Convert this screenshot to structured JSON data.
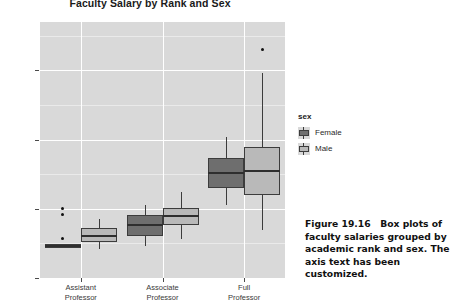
{
  "figure": {
    "title": "Faculty Salary by Rank and Sex",
    "caption_label": "Figure 19.16",
    "caption_text": "Box plots of faculty salaries grouped by academic rank and sex. The axis text has been customized."
  },
  "legend": {
    "title": "sex",
    "items": [
      {
        "label": "Female",
        "color": "#6e6e6e",
        "key_icon": "boxplot-key-icon"
      },
      {
        "label": "Male",
        "color": "#b9b9b9",
        "key_icon": "boxplot-key-icon"
      }
    ]
  },
  "axes": {
    "y_ticks": [
      "$200K",
      "$150K",
      "$100K",
      "$50K"
    ],
    "y_tick_values": [
      200000,
      150000,
      100000,
      50000
    ],
    "x_ticks": [
      {
        "line1": "Assistant",
        "line2": "Professor"
      },
      {
        "line1": "Associate",
        "line2": "Professor"
      },
      {
        "line1": "Full",
        "line2": "Professor"
      }
    ],
    "xlabel": "",
    "ylabel": ""
  },
  "colors": {
    "panel": "#d9d9d9",
    "grid_major": "#ffffff",
    "grid_minor": "#eaeaea",
    "female": "#6e6e6e",
    "male": "#b9b9b9",
    "outline": "#3c3c3c",
    "text": "#2a2a2a",
    "background": "#ffffff"
  },
  "chart_data": {
    "type": "boxplot",
    "title": "Faculty Salary by Rank and Sex",
    "xlabel": "",
    "ylabel": "",
    "ylim": [
      50000,
      235000
    ],
    "ytick_values": [
      50000,
      100000,
      150000,
      200000
    ],
    "ytick_labels": [
      "$50K",
      "$100K",
      "$150K",
      "$200K"
    ],
    "grid": true,
    "legend_position": "right",
    "categories": [
      "Assistant Professor",
      "Associate Professor",
      "Full Professor"
    ],
    "series": [
      {
        "name": "Female",
        "color": "#6e6e6e",
        "boxes": [
          {
            "category": "Assistant Professor",
            "whisker_low": 72000,
            "q1": 72000,
            "median": 73000,
            "q3": 74500,
            "whisker_high": 74500,
            "outliers": [
              100000,
              96000,
              78500
            ]
          },
          {
            "category": "Associate Professor",
            "whisker_low": 73000,
            "q1": 80000,
            "median": 88000,
            "q3": 95500,
            "whisker_high": 103000,
            "outliers": []
          },
          {
            "category": "Full Professor",
            "whisker_low": 103000,
            "q1": 115000,
            "median": 126000,
            "q3": 137000,
            "whisker_high": 152000,
            "outliers": []
          }
        ]
      },
      {
        "name": "Male",
        "color": "#b9b9b9",
        "boxes": [
          {
            "category": "Assistant Professor",
            "whisker_low": 71000,
            "q1": 76000,
            "median": 80000,
            "q3": 86000,
            "whisker_high": 92500,
            "outliers": []
          },
          {
            "category": "Associate Professor",
            "whisker_low": 78000,
            "q1": 88500,
            "median": 95000,
            "q3": 100500,
            "whisker_high": 112000,
            "outliers": []
          },
          {
            "category": "Full Professor",
            "whisker_low": 85000,
            "q1": 110000,
            "median": 127000,
            "q3": 145000,
            "whisker_high": 198000,
            "outliers": [
              215000
            ]
          }
        ]
      }
    ]
  }
}
